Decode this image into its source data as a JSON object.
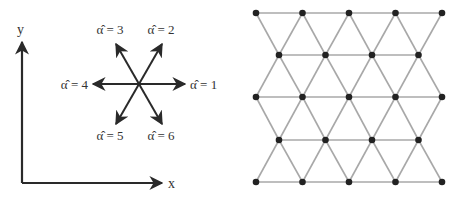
{
  "left_panel": {
    "axes": {
      "x_label": "x",
      "y_label": "y",
      "origin": [
        22,
        183
      ],
      "x_tip": [
        162,
        183
      ],
      "y_tip": [
        22,
        42
      ],
      "color": "#2a2a2a"
    },
    "direction_star": {
      "center": [
        139,
        84
      ],
      "color": "#2a2a2a",
      "vectors": [
        {
          "index": 1,
          "label": "α̂ = 1",
          "tip": [
            185,
            84
          ],
          "label_pos": [
            190,
            89
          ],
          "anchor": "start"
        },
        {
          "index": 2,
          "label": "α̂ = 2",
          "tip": [
            162,
            44
          ],
          "label_pos": [
            161,
            34
          ],
          "anchor": "middle"
        },
        {
          "index": 3,
          "label": "α̂ = 3",
          "tip": [
            116,
            44
          ],
          "label_pos": [
            110,
            34
          ],
          "anchor": "middle"
        },
        {
          "index": 4,
          "label": "α̂ = 4",
          "tip": [
            93,
            84
          ],
          "label_pos": [
            88,
            89
          ],
          "anchor": "end"
        },
        {
          "index": 5,
          "label": "α̂ = 5",
          "tip": [
            116,
            124
          ],
          "label_pos": [
            110,
            140
          ],
          "anchor": "middle"
        },
        {
          "index": 6,
          "label": "α̂ = 6",
          "tip": [
            162,
            124
          ],
          "label_pos": [
            161,
            140
          ],
          "anchor": "middle"
        }
      ]
    }
  },
  "right_panel": {
    "lattice": {
      "type": "triangular",
      "edge_color": "#a8a8a8",
      "node_color": "#222222",
      "node_radius": 3.3,
      "rows": [
        {
          "y": 13,
          "xs": [
            256,
            302.5,
            349,
            395.5,
            442
          ]
        },
        {
          "y": 55,
          "xs": [
            279,
            325.5,
            372,
            418.5
          ]
        },
        {
          "y": 97,
          "xs": [
            256,
            302.5,
            349,
            395.5,
            442
          ]
        },
        {
          "y": 140,
          "xs": [
            279,
            325.5,
            372,
            418.5
          ]
        },
        {
          "y": 182,
          "xs": [
            256,
            302.5,
            349,
            395.5,
            442
          ]
        }
      ]
    }
  }
}
